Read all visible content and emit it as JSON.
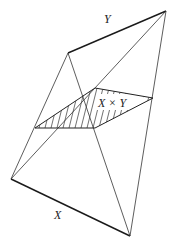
{
  "diagram": {
    "type": "join-of-two-segments",
    "labels": {
      "x_segment": "X",
      "y_segment": "Y",
      "product_section": "X × Y"
    },
    "vertices": {
      "x_start": [
        11,
        179
      ],
      "x_end": [
        130,
        236
      ],
      "y_start": [
        68,
        53
      ],
      "y_end": [
        166,
        11
      ],
      "section_left": [
        35,
        128
      ],
      "section_top": [
        95,
        88
      ],
      "section_right": [
        153,
        98
      ],
      "section_bottom": [
        95,
        128
      ]
    },
    "colors": {
      "line": "#1a1a1a",
      "background": "#ffffff"
    }
  }
}
